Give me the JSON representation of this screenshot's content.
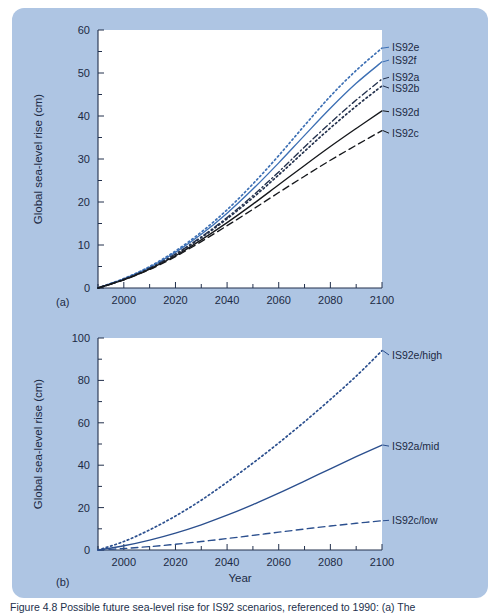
{
  "figure": {
    "background_color": "#aec5e3",
    "plot_background": "#ffffff",
    "caption": "Figure 4.8  Possible future sea-level rise for IS92 scenarios, referenced to 1990: (a) The"
  },
  "panels": [
    {
      "id": "a",
      "letter": "(a)",
      "xlabel": "Year",
      "ylabel": "Global sea-level rise (cm)"
    },
    {
      "id": "b",
      "letter": "(b)",
      "xlabel": "Year",
      "ylabel": "Global sea-level rise (cm)"
    }
  ],
  "chart_data": [
    {
      "type": "line",
      "panel": "a",
      "title": "",
      "xlabel": "Year",
      "ylabel": "Global sea-level rise (cm)",
      "xlim": [
        1990,
        2100
      ],
      "ylim": [
        0,
        60
      ],
      "xticks": [
        2000,
        2020,
        2040,
        2060,
        2080,
        2100
      ],
      "xtick_labels": [
        "2000",
        "2020",
        "2040",
        "2060",
        "2080",
        "2100"
      ],
      "yticks": [
        0,
        10,
        20,
        30,
        40,
        50,
        60
      ],
      "ytick_labels": [
        "0",
        "10",
        "20",
        "30",
        "40",
        "50",
        "60"
      ],
      "yminor_step": 5,
      "xminor_step": 10,
      "grid": false,
      "legend_position": "right-of-axes",
      "x": [
        1990,
        2000,
        2010,
        2020,
        2030,
        2040,
        2050,
        2060,
        2070,
        2080,
        2090,
        2100
      ],
      "series": [
        {
          "name": "IS92e",
          "label": "IS92e",
          "color": "#3c6fb4",
          "style": "dotted",
          "label_y": 56,
          "values": [
            0,
            2.2,
            5.0,
            8.6,
            13.0,
            18.2,
            24.2,
            30.8,
            37.8,
            44.6,
            50.6,
            55.8
          ]
        },
        {
          "name": "IS92f",
          "label": "IS92f",
          "color": "#3c6fb4",
          "style": "solid",
          "label_y": 53,
          "values": [
            0,
            2.1,
            4.8,
            8.3,
            12.5,
            17.4,
            23.0,
            29.1,
            35.5,
            41.8,
            47.6,
            52.6
          ]
        },
        {
          "name": "IS92a",
          "label": "IS92a",
          "color": "#22304c",
          "style": "dashdot",
          "label_y": 49,
          "values": [
            0,
            2.0,
            4.6,
            7.9,
            11.9,
            16.4,
            21.5,
            27.0,
            32.8,
            38.4,
            43.7,
            48.6
          ]
        },
        {
          "name": "IS92b",
          "label": "IS92b",
          "color": "#22304c",
          "style": "dotted",
          "label_y": 46.5,
          "values": [
            0,
            2.0,
            4.5,
            7.8,
            11.7,
            16.1,
            21.0,
            26.3,
            31.8,
            37.2,
            42.3,
            47.0
          ]
        },
        {
          "name": "IS92d",
          "label": "IS92d",
          "color": "#16181c",
          "style": "solid",
          "label_y": 41,
          "values": [
            0,
            1.9,
            4.4,
            7.5,
            11.2,
            15.2,
            19.5,
            24.0,
            28.5,
            32.9,
            37.1,
            41.2
          ]
        },
        {
          "name": "IS92c",
          "label": "IS92c",
          "color": "#16181c",
          "style": "dashed",
          "label_y": 36,
          "values": [
            0,
            1.9,
            4.3,
            7.3,
            10.8,
            14.5,
            18.3,
            22.2,
            26.0,
            29.7,
            33.2,
            36.6
          ]
        }
      ]
    },
    {
      "type": "line",
      "panel": "b",
      "title": "",
      "xlabel": "Year",
      "ylabel": "Global sea-level rise (cm)",
      "xlim": [
        1990,
        2100
      ],
      "ylim": [
        0,
        100
      ],
      "xticks": [
        2000,
        2020,
        2040,
        2060,
        2080,
        2100
      ],
      "xtick_labels": [
        "2000",
        "2020",
        "2040",
        "2060",
        "2080",
        "2100"
      ],
      "yticks": [
        0,
        20,
        40,
        60,
        80,
        100
      ],
      "ytick_labels": [
        "0",
        "20",
        "40",
        "60",
        "80",
        "100"
      ],
      "yminor_step": 10,
      "xminor_step": 10,
      "grid": false,
      "legend_position": "right-of-axes",
      "x": [
        1990,
        2000,
        2010,
        2020,
        2030,
        2040,
        2050,
        2060,
        2070,
        2080,
        2090,
        2100
      ],
      "series": [
        {
          "name": "IS92e-high",
          "label": "IS92e/high",
          "color": "#2b4f8e",
          "style": "dotted",
          "label_y": 92,
          "values": [
            0,
            4.0,
            9.5,
            16.0,
            23.5,
            32.0,
            41.0,
            50.5,
            60.5,
            71.0,
            82.0,
            94.0
          ]
        },
        {
          "name": "IS92a-mid",
          "label": "IS92a/mid",
          "color": "#2b4f8e",
          "style": "solid",
          "label_y": 49,
          "values": [
            0,
            2.0,
            4.7,
            8.0,
            11.9,
            16.4,
            21.4,
            26.8,
            32.5,
            38.3,
            44.0,
            49.5
          ]
        },
        {
          "name": "IS92c-low",
          "label": "IS92c/low",
          "color": "#2b4f8e",
          "style": "dashed",
          "label_y": 14,
          "values": [
            0,
            0.7,
            1.6,
            2.7,
            4.0,
            5.4,
            6.9,
            8.4,
            9.9,
            11.3,
            12.6,
            13.8
          ]
        }
      ]
    }
  ]
}
